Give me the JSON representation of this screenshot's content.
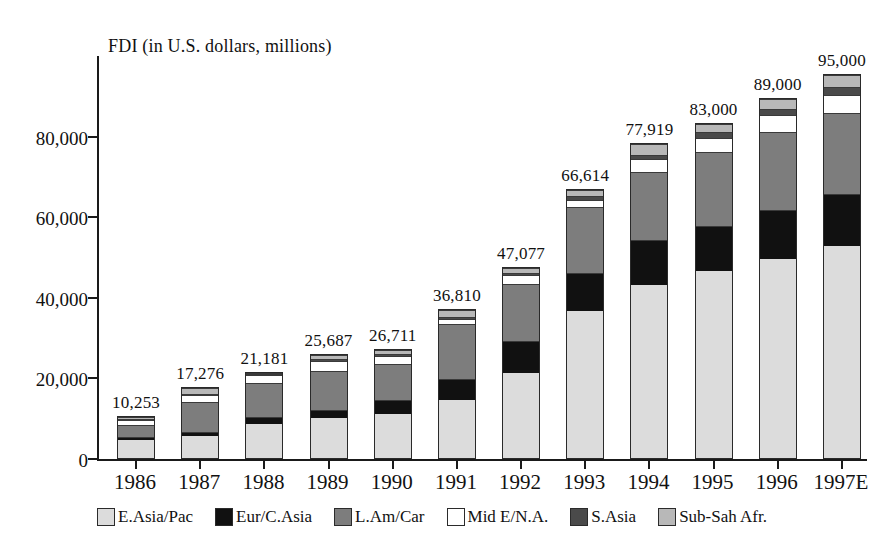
{
  "chart_data": {
    "type": "bar",
    "subtype": "stacked-bar",
    "title": "FDI (in U.S. dollars, millions)",
    "xlabel": "",
    "ylabel": "FDI (in U.S. dollars, millions)",
    "ylim": [
      0,
      100000
    ],
    "yticks": [
      0,
      20000,
      40000,
      60000,
      80000
    ],
    "ytick_labels": [
      "0",
      "20,000",
      "40,000",
      "60,000",
      "80,000"
    ],
    "grid": false,
    "legend_position": "bottom",
    "categories": [
      "1986",
      "1987",
      "1988",
      "1989",
      "1990",
      "1991",
      "1992",
      "1993",
      "1994",
      "1995",
      "1996",
      "1997E"
    ],
    "totals": [
      10253,
      17276,
      21181,
      25687,
      26711,
      36810,
      47077,
      66614,
      77919,
      83000,
      89000,
      95000
    ],
    "total_labels": [
      "10,253",
      "17,276",
      "21,181",
      "25,687",
      "26,711",
      "36,810",
      "47,077",
      "66,614",
      "77,919",
      "83,000",
      "89,000",
      "95,000"
    ],
    "series": [
      {
        "name": "E.Asia/Pac",
        "color": "#dcdcdc",
        "values": [
          4500,
          5500,
          8500,
          10000,
          11000,
          14500,
          21200,
          36500,
          43000,
          46500,
          49500,
          52500
        ]
      },
      {
        "name": "Eur/C.Asia",
        "color": "#111111",
        "values": [
          600,
          900,
          1700,
          2000,
          3500,
          5000,
          7800,
          9500,
          11000,
          11000,
          12000,
          13000
        ]
      },
      {
        "name": "L.Am/Car",
        "color": "#7d7d7d",
        "values": [
          3000,
          7500,
          8500,
          9500,
          8800,
          13800,
          14300,
          16200,
          17000,
          18500,
          19500,
          20000
        ]
      },
      {
        "name": "Mid E/N.A.",
        "color": "#ffffff",
        "values": [
          1300,
          1700,
          1900,
          2700,
          2100,
          1200,
          2000,
          1800,
          3100,
          3300,
          4000,
          4500
        ]
      },
      {
        "name": "S.Asia",
        "color": "#4a4a4a",
        "values": [
          250,
          300,
          250,
          400,
          350,
          500,
          700,
          900,
          1100,
          1500,
          1700,
          2000
        ]
      },
      {
        "name": "Sub-Sah Afr.",
        "color": "#b8b8b8",
        "values": [
          603,
          1376,
          331,
          1087,
          961,
          1810,
          1077,
          1714,
          2719,
          2200,
          2300,
          3000
        ]
      }
    ]
  },
  "legend": {
    "items": [
      {
        "label": "E.Asia/Pac",
        "color": "#dcdcdc"
      },
      {
        "label": "Eur/C.Asia",
        "color": "#111111"
      },
      {
        "label": "L.Am/Car",
        "color": "#7d7d7d"
      },
      {
        "label": "Mid E/N.A.",
        "color": "#ffffff"
      },
      {
        "label": "S.Asia",
        "color": "#4a4a4a"
      },
      {
        "label": "Sub-Sah Afr.",
        "color": "#b8b8b8"
      }
    ]
  }
}
